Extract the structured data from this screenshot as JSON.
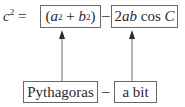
{
  "equation": {
    "lhs_base": "c",
    "lhs_exp": "2",
    "equals": "=",
    "term1": {
      "open": "(",
      "a": "a",
      "a_exp": "2",
      "plus": "+",
      "b": "b",
      "b_exp": "2",
      "close": ")"
    },
    "minus": "–",
    "term2": {
      "coef": "2",
      "vars": "ab",
      "func": "cos",
      "angle": "C"
    }
  },
  "labels": {
    "term1_label": "Pythagoras",
    "minus": "–",
    "term2_label": "a bit"
  },
  "colors": {
    "stroke": "#6a6a6a",
    "text": "#2a2a2a"
  }
}
